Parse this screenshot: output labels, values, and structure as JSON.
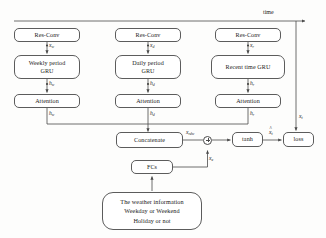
{
  "diagram": {
    "title_label": "time",
    "nodes": {
      "resconv_w": "Res-Conv",
      "resconv_d": "Res-Conv",
      "resconv_r": "Res-Conv",
      "gru_w_line1": "Weekly period",
      "gru_w_line2": "GRU",
      "gru_d_line1": "Daily period",
      "gru_d_line2": "GRU",
      "gru_r_line1": "Recent time GRU",
      "attention_w": "Attention",
      "attention_d": "Attention",
      "attention_r": "Attention",
      "concatenate": "Concatenate",
      "tanh": "tanh",
      "loss": "loss",
      "fcs": "FCs",
      "weather_line1": "The weather information",
      "weather_line2": "Weekday or Weekend",
      "weather_line3": "Holiday or not"
    },
    "edge_labels": {
      "x_w_var": "x",
      "x_w_sub": "w",
      "x_d_var": "x",
      "x_d_sub": "d",
      "x_r_var": "x",
      "x_r_sub": "r",
      "h_w1_var": "h",
      "h_w1_sub": "w",
      "h_d1_var": "h",
      "h_d1_sub": "d",
      "h_r1_var": "h",
      "h_r1_sub": "r",
      "h_w2_var": "h",
      "h_w2_sub": "w",
      "h_d2_var": "h",
      "h_d2_sub": "d",
      "h_r2_var": "h",
      "h_r2_sub": "r",
      "x_rdw_var": "x",
      "x_rdw_sub": "rdw",
      "x_e_var": "x",
      "x_e_sub": "e",
      "x_hat_t_var": "x",
      "x_hat_t_sub": "t",
      "x_hat_t_accent": "^",
      "x_t_var": "x",
      "x_t_sub": "t"
    },
    "operators": {
      "sum": "plus-circle"
    },
    "colors": {
      "stroke": "#5c5c5c",
      "line": "#4a4a4a",
      "text": "#1a1a1a",
      "background": "#fdfdfc"
    }
  }
}
